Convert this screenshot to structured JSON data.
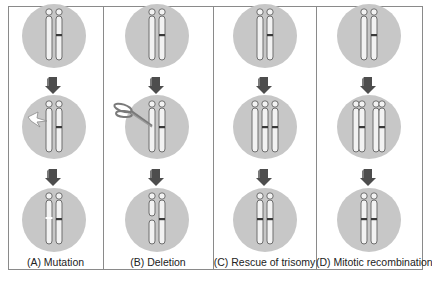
{
  "figure": {
    "panels": [
      {
        "id": "A",
        "label": "(A) Mutation",
        "event": "mutation",
        "event_icon": "lightning-bolt-icon"
      },
      {
        "id": "B",
        "label": "(B) Deletion",
        "event": "deletion",
        "event_icon": "scissors-icon"
      },
      {
        "id": "C",
        "label": "(C) Rescue of trisomy",
        "event": "trisomy-rescue",
        "event_icon": "none"
      },
      {
        "id": "D",
        "label": "(D) Mitotic recombination",
        "event": "mitotic-recombination",
        "event_icon": "none"
      }
    ],
    "colors": {
      "circle": "#c7c7c7",
      "arrow": "#4d4d4d",
      "chromosome_fill": "#f2f2f2",
      "chromosome_outline": "#6e6e6e",
      "band": "#3a3a3a",
      "frame": "#8a8a8a"
    }
  }
}
